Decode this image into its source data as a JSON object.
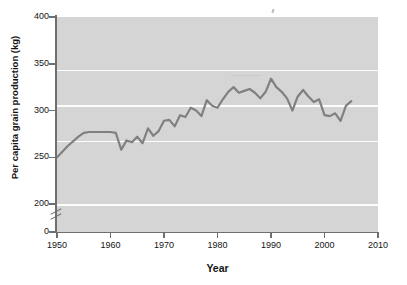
{
  "chart_data": {
    "type": "line",
    "title": "",
    "xlabel": "Year",
    "ylabel": "Per capita grain production (kg)",
    "xlim": [
      1950,
      2010
    ],
    "ylim": [
      0,
      400
    ],
    "y_axis_break": true,
    "y_break_between": [
      0,
      200
    ],
    "grid": true,
    "gridlines_y": [
      250,
      300,
      350
    ],
    "legend": "none",
    "xticks": [
      1950,
      1960,
      1970,
      1980,
      1990,
      2000,
      2010
    ],
    "yticks": [
      0,
      200,
      250,
      300,
      350,
      400
    ],
    "xtick_labels": [
      "1950",
      "1960",
      "1970",
      "1980",
      "1990",
      "2000",
      "2010"
    ],
    "ytick_labels": [
      "0",
      "200",
      "250",
      "300",
      "350",
      "400"
    ],
    "series": [
      {
        "name": "Per capita grain production",
        "color": "#808080",
        "x": [
          1950,
          1951,
          1952,
          1953,
          1954,
          1955,
          1956,
          1957,
          1958,
          1959,
          1960,
          1961,
          1962,
          1963,
          1964,
          1965,
          1966,
          1967,
          1968,
          1969,
          1970,
          1971,
          1972,
          1973,
          1974,
          1975,
          1976,
          1977,
          1978,
          1979,
          1980,
          1981,
          1982,
          1983,
          1984,
          1985,
          1986,
          1987,
          1988,
          1989,
          1990,
          1991,
          1992,
          1993,
          1994,
          1995,
          1996,
          1997,
          1998,
          1999,
          2000,
          2001,
          2002,
          2003,
          2004,
          2005
        ],
        "values": [
          250,
          256,
          262,
          267,
          272,
          276,
          277,
          277,
          277,
          277,
          277,
          276,
          258,
          268,
          266,
          272,
          265,
          281,
          273,
          278,
          289,
          290,
          283,
          295,
          293,
          303,
          300,
          294,
          311,
          305,
          303,
          312,
          320,
          325,
          319,
          321,
          323,
          319,
          313,
          320,
          334,
          325,
          320,
          313,
          300,
          315,
          322,
          315,
          309,
          312,
          295,
          294,
          297,
          289,
          305,
          310
        ]
      }
    ]
  },
  "axis": {
    "y_break_symbol": "double-slash"
  }
}
